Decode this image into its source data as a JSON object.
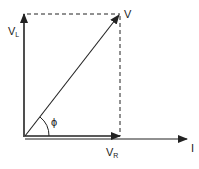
{
  "diagram": {
    "type": "phasor",
    "labels": {
      "vl": "V",
      "vl_sub": "L",
      "v": "V",
      "phi": "ϕ",
      "vr": "V",
      "vr_sub": "R",
      "i": "I"
    },
    "colors": {
      "stroke": "#222222",
      "background": "#ffffff"
    }
  }
}
